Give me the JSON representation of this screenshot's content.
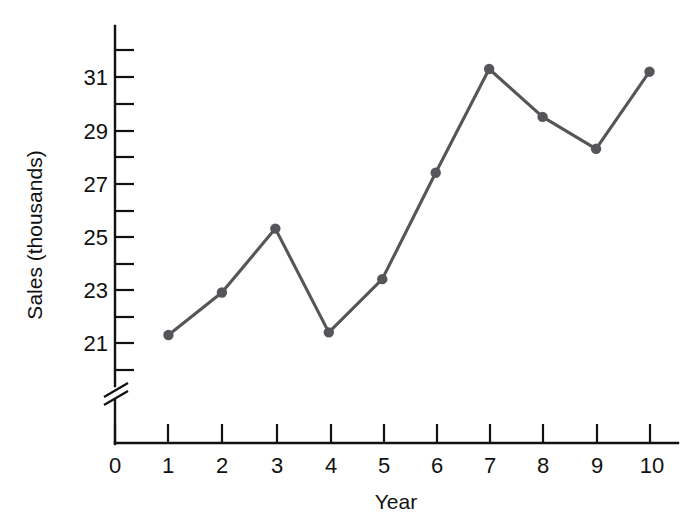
{
  "chart_data": {
    "type": "line",
    "title": "",
    "xlabel": "Year",
    "ylabel": "Sales (thousands)",
    "x": [
      1,
      2,
      3,
      4,
      5,
      6,
      7,
      8,
      9,
      10
    ],
    "values": [
      21.3,
      22.9,
      25.3,
      21.4,
      23.4,
      27.4,
      31.3,
      29.5,
      28.3,
      31.2
    ],
    "series": [
      {
        "name": "Sales",
        "values": [
          21.3,
          22.9,
          25.3,
          21.4,
          23.4,
          27.4,
          31.3,
          29.5,
          28.3,
          31.2
        ]
      }
    ],
    "x_tick_labels": [
      "0",
      "1",
      "2",
      "3",
      "4",
      "5",
      "6",
      "7",
      "8",
      "9",
      "10"
    ],
    "x_tick_values": [
      0,
      1,
      2,
      3,
      4,
      5,
      6,
      7,
      8,
      9,
      10
    ],
    "y_tick_labels": [
      "21",
      "23",
      "25",
      "27",
      "29",
      "31"
    ],
    "y_tick_values": [
      21,
      23,
      25,
      27,
      29,
      31
    ],
    "y_minor_tick_values": [
      20,
      22,
      24,
      26,
      28,
      30,
      32
    ],
    "xlim": [
      0,
      10
    ],
    "ylim": [
      20,
      32
    ],
    "grid": false,
    "legend": false,
    "legend_position": "none",
    "axis_break": true,
    "axis_break_axis": "y",
    "marker": "circle",
    "line_color": "#55555a",
    "marker_color": "#55555a",
    "axis_color": "#111111",
    "background_color": "#ffffff"
  },
  "labels": {
    "y_axis_title": "Sales (thousands)",
    "x_axis_title": "Year"
  }
}
